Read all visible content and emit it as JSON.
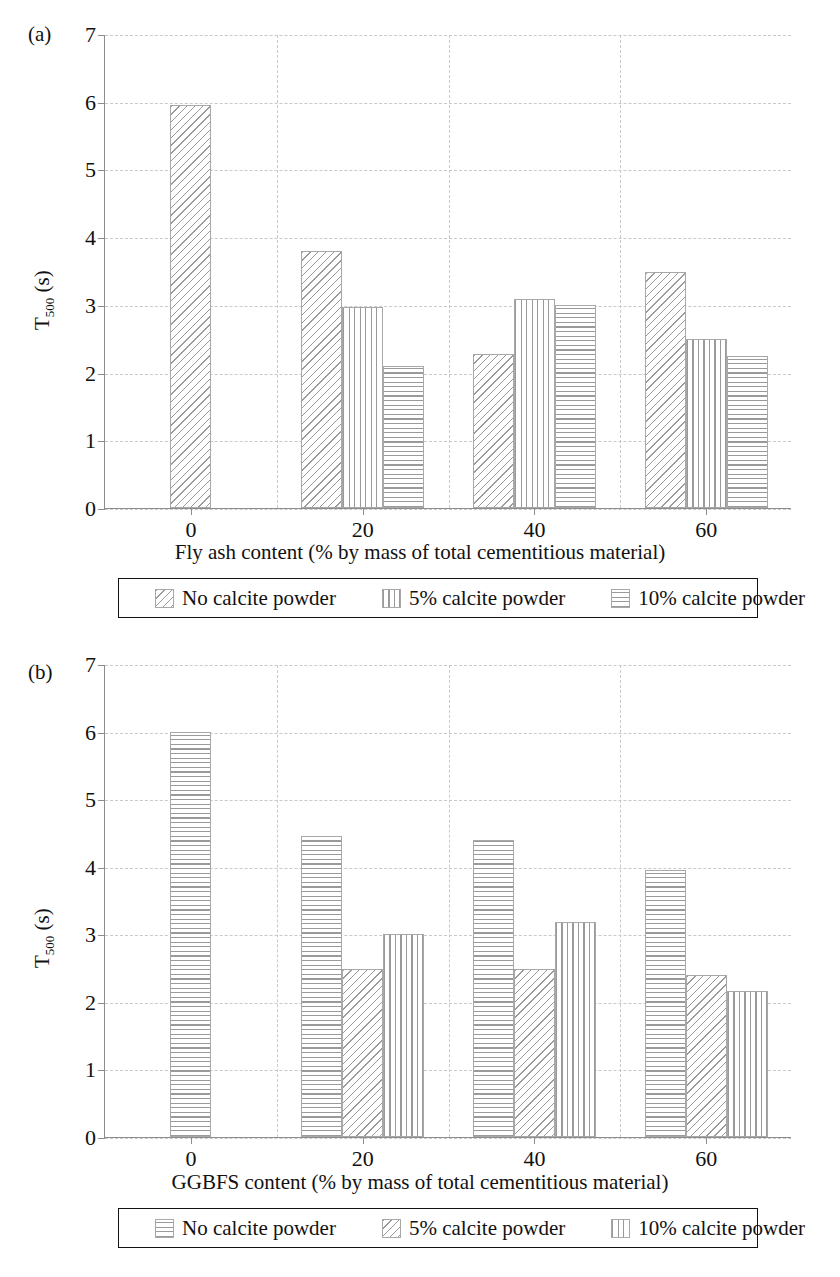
{
  "figure": {
    "panels": [
      {
        "tag": "(a)",
        "chart_data": {
          "type": "bar",
          "title": "",
          "xlabel": "Fly ash content (% by mass of total cementitious material)",
          "ylabel": "T500 (s)",
          "ylabel_base": "T",
          "ylabel_sub": "500",
          "ylabel_unit": " (s)",
          "categories": [
            "0",
            "20",
            "40",
            "60"
          ],
          "xticks": [
            "0",
            "20",
            "40",
            "60"
          ],
          "yticks": [
            "0",
            "1",
            "2",
            "3",
            "4",
            "5",
            "6",
            "7"
          ],
          "ylim": [
            0,
            7
          ],
          "grid": true,
          "legend_position": "below",
          "series": [
            {
              "name": "No calcite powder",
              "pattern": "diagonal",
              "values": [
                5.95,
                3.8,
                2.28,
                3.49
              ]
            },
            {
              "name": "5% calcite powder",
              "pattern": "vertical",
              "values": [
                null,
                2.97,
                3.08,
                2.5
              ]
            },
            {
              "name": "10% calcite powder",
              "pattern": "horizontal",
              "values": [
                null,
                2.1,
                3.0,
                2.25
              ]
            }
          ]
        },
        "legend": [
          {
            "label": "No calcite powder",
            "pattern": "diagonal"
          },
          {
            "label": "5% calcite powder",
            "pattern": "vertical"
          },
          {
            "label": "10% calcite powder",
            "pattern": "horizontal"
          }
        ]
      },
      {
        "tag": "(b)",
        "chart_data": {
          "type": "bar",
          "title": "",
          "xlabel": "GGBFS content (% by mass of total cementitious material)",
          "ylabel": "T500 (s)",
          "ylabel_base": "T",
          "ylabel_sub": "500",
          "ylabel_unit": " (s)",
          "categories": [
            "0",
            "20",
            "40",
            "60"
          ],
          "xticks": [
            "0",
            "20",
            "40",
            "60"
          ],
          "yticks": [
            "0",
            "1",
            "2",
            "3",
            "4",
            "5",
            "6",
            "7"
          ],
          "ylim": [
            0,
            7
          ],
          "grid": true,
          "legend_position": "below",
          "series": [
            {
              "name": "No calcite powder",
              "pattern": "horizontal",
              "values": [
                6.0,
                4.45,
                4.4,
                3.95
              ]
            },
            {
              "name": "5% calcite powder",
              "pattern": "diagonal",
              "values": [
                null,
                2.48,
                2.48,
                2.4
              ]
            },
            {
              "name": "10% calcite powder",
              "pattern": "vertical",
              "values": [
                null,
                3.0,
                3.18,
                2.16
              ]
            }
          ]
        },
        "legend": [
          {
            "label": "No calcite powder",
            "pattern": "horizontal"
          },
          {
            "label": "5% calcite powder",
            "pattern": "diagonal"
          },
          {
            "label": "10% calcite powder",
            "pattern": "vertical"
          }
        ]
      }
    ],
    "colors": {
      "hatch": "#9a9a9a",
      "axis": "#8d8d8d",
      "grid": "#c9c9c9",
      "text": "#111111",
      "background": "#ffffff"
    }
  }
}
